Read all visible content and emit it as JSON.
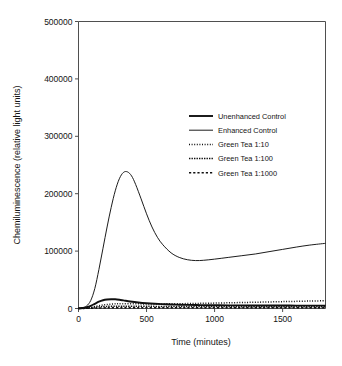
{
  "chart_data": {
    "type": "line",
    "title": "",
    "xlabel": "Time (minutes)",
    "ylabel": "Chemiluminescence (relative light units)",
    "xlim": [
      0,
      1815
    ],
    "ylim": [
      0,
      500000
    ],
    "xticks": [
      0,
      500,
      1000,
      1500
    ],
    "xtick_labels": [
      "0",
      "500",
      "1000",
      "1500"
    ],
    "yticks": [
      0,
      100000,
      200000,
      300000,
      400000,
      500000
    ],
    "ytick_labels": [
      "0",
      "100000",
      "200000",
      "300000",
      "400000",
      "500000"
    ],
    "grid": false,
    "legend_position": "upper center-right",
    "series": [
      {
        "name": "Unenhanced Control",
        "style": "solid-thick",
        "stroke_width": 1.9,
        "dash": "none",
        "x": [
          0,
          30,
          60,
          90,
          120,
          150,
          180,
          210,
          240,
          270,
          300,
          330,
          380,
          440,
          500,
          560,
          640,
          720,
          800,
          900,
          1000,
          1100,
          1250,
          1400,
          1550,
          1700,
          1815
        ],
        "y": [
          400,
          900,
          2200,
          4600,
          8200,
          11800,
          14300,
          15600,
          16100,
          16000,
          15200,
          14100,
          12200,
          10400,
          9100,
          8200,
          7300,
          6700,
          6300,
          5900,
          5700,
          5500,
          5300,
          5200,
          5100,
          5000,
          5000
        ]
      },
      {
        "name": "Enhanced Control",
        "style": "solid-thin",
        "stroke_width": 0.95,
        "dash": "none",
        "x": [
          0,
          30,
          60,
          90,
          120,
          150,
          180,
          210,
          240,
          270,
          300,
          330,
          360,
          390,
          420,
          460,
          500,
          540,
          580,
          620,
          680,
          740,
          800,
          860,
          920,
          1000,
          1100,
          1200,
          1300,
          1400,
          1500,
          1600,
          1700,
          1815
        ],
        "y": [
          300,
          1200,
          4500,
          14000,
          35000,
          68000,
          105000,
          142000,
          176000,
          205000,
          226000,
          237000,
          238000,
          231000,
          216000,
          191000,
          165000,
          142000,
          124000,
          111000,
          97000,
          89000,
          85000,
          83500,
          84000,
          86000,
          89000,
          92000,
          95000,
          99000,
          103000,
          107000,
          110500,
          113500
        ]
      },
      {
        "name": "Green Tea 1:10",
        "style": "dotted-fine",
        "stroke_width": 1.5,
        "dash": "1,1.6",
        "x": [
          0,
          40,
          80,
          120,
          160,
          200,
          240,
          280,
          320,
          380,
          440,
          500,
          580,
          660,
          760,
          860,
          960,
          1080,
          1200,
          1320,
          1450,
          1570,
          1700,
          1815
        ],
        "y": [
          200,
          500,
          1500,
          3300,
          5200,
          6700,
          7700,
          8200,
          8400,
          8300,
          8100,
          8000,
          8000,
          8100,
          8400,
          8800,
          9200,
          9800,
          10400,
          11000,
          11700,
          12300,
          13000,
          13500
        ]
      },
      {
        "name": "Green Tea 1:100",
        "style": "dotted-dense",
        "stroke_width": 1.5,
        "dash": "1.4,1.1",
        "x": [
          0,
          40,
          80,
          120,
          160,
          200,
          260,
          320,
          400,
          500,
          620,
          760,
          900,
          1050,
          1200,
          1400,
          1600,
          1815
        ],
        "y": [
          150,
          400,
          1100,
          2100,
          3000,
          3600,
          4000,
          4100,
          4000,
          3800,
          3600,
          3500,
          3400,
          3300,
          3200,
          3100,
          3000,
          3000
        ]
      },
      {
        "name": "Green Tea 1:1000",
        "style": "dotted-coarse",
        "stroke_width": 1.5,
        "dash": "2.2,2.0",
        "x": [
          0,
          60,
          120,
          200,
          300,
          420,
          560,
          720,
          900,
          1100,
          1300,
          1550,
          1815
        ],
        "y": [
          100,
          300,
          700,
          1100,
          1300,
          1400,
          1400,
          1350,
          1300,
          1250,
          1200,
          1150,
          1100
        ]
      }
    ]
  },
  "legend": {
    "items": [
      {
        "label": "Unenhanced Control"
      },
      {
        "label": "Enhanced Control"
      },
      {
        "label": "Green Tea 1:10"
      },
      {
        "label": "Green Tea 1:100"
      },
      {
        "label": "Green Tea 1:1000"
      }
    ]
  },
  "colors": {
    "ink": "#101010",
    "frame": "#4f4f4f",
    "background": "#ffffff"
  }
}
